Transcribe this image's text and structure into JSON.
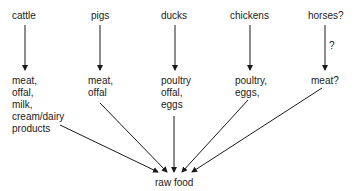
{
  "sources": [
    {
      "id": "cattle",
      "label": "cattle"
    },
    {
      "id": "pigs",
      "label": "pigs"
    },
    {
      "id": "ducks",
      "label": "ducks"
    },
    {
      "id": "chickens",
      "label": "chickens"
    },
    {
      "id": "horses",
      "label": "horses?"
    }
  ],
  "products": [
    {
      "id": "cattle",
      "label": "meat,\noffal,\nmilk,\ncream/dairy\nproducts"
    },
    {
      "id": "pigs",
      "label": "meat,\noffal"
    },
    {
      "id": "ducks",
      "label": "poultry\noffal,\neggs"
    },
    {
      "id": "chickens",
      "label": "poultry,\neggs,"
    },
    {
      "id": "horses",
      "label": "meat?"
    }
  ],
  "edge_labels": {
    "horses_question": "?"
  },
  "target": {
    "label": "raw food"
  }
}
